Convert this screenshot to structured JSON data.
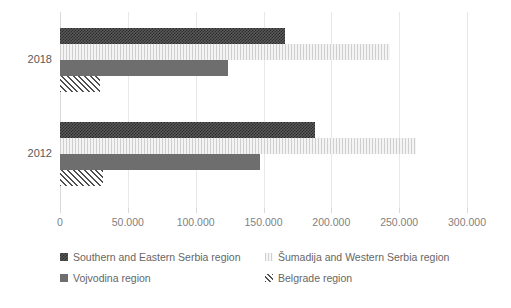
{
  "chart_data": {
    "type": "bar",
    "orientation": "horizontal",
    "title": "",
    "subtitle": "",
    "xlabel": "",
    "ylabel": "",
    "categories": [
      "2018",
      "2012"
    ],
    "xlim": [
      0,
      300000
    ],
    "xticks": [
      0,
      50000,
      100000,
      150000,
      200000,
      250000,
      300000
    ],
    "xtick_labels": [
      "0",
      "50.000",
      "100.000",
      "150.000",
      "200.000",
      "250.000",
      "300.000"
    ],
    "grid": true,
    "legend_position": "bottom",
    "series": [
      {
        "name": "Southern and Eastern Serbia region",
        "pattern": "checker",
        "color": "#595959",
        "values": [
          166000,
          188000
        ]
      },
      {
        "name": "Šumadija and Western Serbia region",
        "pattern": "vertical-lines",
        "color": "#e8e8e8",
        "values": [
          243000,
          262500
        ]
      },
      {
        "name": "Vojvodina region",
        "pattern": "solid",
        "color": "#6e6e6e",
        "values": [
          124000,
          147500
        ]
      },
      {
        "name": "Belgrade region",
        "pattern": "diagonal-lines",
        "color": "#4f4f4f",
        "values": [
          29500,
          31700
        ]
      }
    ]
  },
  "axis": {
    "ticks": [
      {
        "label": "0"
      },
      {
        "label": "50.000"
      },
      {
        "label": "100.000"
      },
      {
        "label": "150.000"
      },
      {
        "label": "200.000"
      },
      {
        "label": "250.000"
      },
      {
        "label": "300.000"
      }
    ],
    "categories": [
      {
        "label": "2018"
      },
      {
        "label": "2012"
      }
    ]
  },
  "legend": {
    "items": [
      {
        "label": "Southern and Eastern Serbia region",
        "pattern": "p-checker"
      },
      {
        "label": "Šumadija and Western Serbia region",
        "pattern": "p-vlines"
      },
      {
        "label": "Vojvodina region",
        "pattern": "p-solid"
      },
      {
        "label": "Belgrade region",
        "pattern": "p-diag"
      }
    ]
  }
}
